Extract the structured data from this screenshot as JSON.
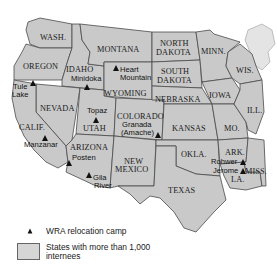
{
  "map": {
    "fill_color": "#c9c9c9",
    "border_color": "#4a4a4a",
    "states": [
      {
        "id": "wa",
        "label": "WASH."
      },
      {
        "id": "or",
        "label": "OREGON"
      },
      {
        "id": "ca",
        "label": "CALIF."
      },
      {
        "id": "nv",
        "label": "NEVADA"
      },
      {
        "id": "id",
        "label": "IDAHO"
      },
      {
        "id": "mt",
        "label": "MONTANA"
      },
      {
        "id": "wy",
        "label": "WYOMING"
      },
      {
        "id": "ut",
        "label": "UTAH"
      },
      {
        "id": "az",
        "label": "ARIZONA"
      },
      {
        "id": "co",
        "label": "COLORADO"
      },
      {
        "id": "nm1",
        "label": "NEW"
      },
      {
        "id": "nm2",
        "label": "MEXICO"
      },
      {
        "id": "nd1",
        "label": "NORTH"
      },
      {
        "id": "nd2",
        "label": "DAKOTA"
      },
      {
        "id": "sd1",
        "label": "SOUTH"
      },
      {
        "id": "sd2",
        "label": "DAKOTA"
      },
      {
        "id": "ne",
        "label": "NEBRASKA"
      },
      {
        "id": "ks",
        "label": "KANSAS"
      },
      {
        "id": "ok",
        "label": "OKLA."
      },
      {
        "id": "tx",
        "label": "TEXAS"
      },
      {
        "id": "mn",
        "label": "MINN."
      },
      {
        "id": "ia",
        "label": "IOWA"
      },
      {
        "id": "mo",
        "label": "MO."
      },
      {
        "id": "ar",
        "label": "ARK."
      },
      {
        "id": "la",
        "label": "LA."
      },
      {
        "id": "wi",
        "label": "WIS."
      },
      {
        "id": "il",
        "label": "ILL."
      },
      {
        "id": "ms",
        "label": "MISS."
      }
    ],
    "camps": [
      {
        "name_line1": "Tule",
        "name_line2": "Lake"
      },
      {
        "name_line1": "Manzanar",
        "name_line2": ""
      },
      {
        "name_line1": "Minidoka",
        "name_line2": ""
      },
      {
        "name_line1": "Heart",
        "name_line2": "Mountain"
      },
      {
        "name_line1": "Topaz",
        "name_line2": ""
      },
      {
        "name_line1": "Granada",
        "name_line2": "(Amache)"
      },
      {
        "name_line1": "Posten",
        "name_line2": ""
      },
      {
        "name_line1": "Gila",
        "name_line2": "River"
      },
      {
        "name_line1": "Rohwer",
        "name_line2": ""
      },
      {
        "name_line1": "Jerome",
        "name_line2": ""
      }
    ]
  },
  "legend": {
    "camp_label": "WRA relocation camp",
    "states_label_line1": "States with more than 1,000",
    "states_label_line2": "internees"
  }
}
